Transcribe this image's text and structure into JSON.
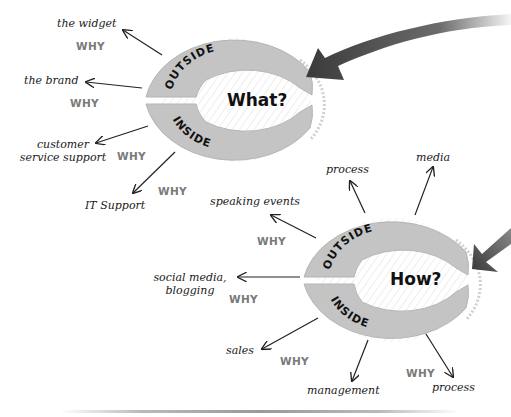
{
  "colors": {
    "ring": "#c4c4c4",
    "ring_stroke": "#b0b0b0",
    "big_arrow": "#3a3a3a",
    "why_text": "#7a7a7a",
    "label_text": "#1a1a1a"
  },
  "what_diagram": {
    "center_label": "What?",
    "outside_label": "OUTSIDE",
    "inside_label": "INSIDE",
    "outside_items": [
      {
        "label": "the widget",
        "why": "WHY"
      },
      {
        "label": "the brand",
        "why": "WHY"
      }
    ],
    "inside_items": [
      {
        "label": "customer service support",
        "line1": "customer",
        "line2": "service support",
        "why": "WHY"
      },
      {
        "label": "IT Support",
        "why": "WHY"
      }
    ]
  },
  "how_diagram": {
    "center_label": "How?",
    "outside_label": "OUTSIDE",
    "inside_label": "INSIDE",
    "outside_items": [
      {
        "label": "speaking events",
        "why": "WHY"
      },
      {
        "label": "process",
        "why": ""
      },
      {
        "label": "media",
        "why": ""
      },
      {
        "label": "social media, blogging",
        "line1": "social media,",
        "line2": "blogging",
        "why": "WHY"
      }
    ],
    "inside_items": [
      {
        "label": "sales",
        "why": "WHY"
      },
      {
        "label": "management",
        "why": ""
      },
      {
        "label": "process",
        "why": "WHY"
      }
    ]
  }
}
